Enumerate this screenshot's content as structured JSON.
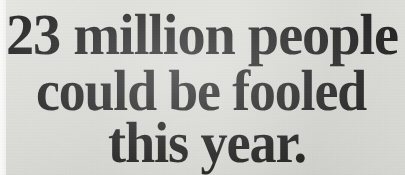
{
  "document": {
    "type": "print-advertisement-headline",
    "media": "scanned newspaper/magazine page",
    "background_color": "#e9e9e7",
    "ink_color": "#1b1b1b"
  },
  "headline": {
    "full_text": "23 million people could be fooled this year.",
    "lines": [
      {
        "text": "23 million people",
        "align": "left"
      },
      {
        "text": "could be fooled",
        "align": "center"
      },
      {
        "text": "this year.",
        "align": "center"
      }
    ],
    "number_callout": "23 million",
    "period": "."
  },
  "subhead": {
    "visible": "partially-cropped",
    "text": "",
    "color": "#8d8d8b"
  }
}
